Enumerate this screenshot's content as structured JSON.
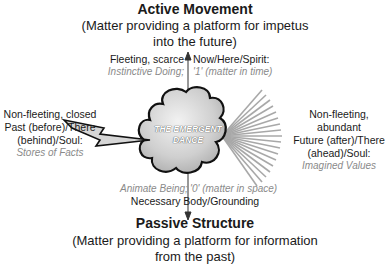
{
  "top": {
    "title": "Active Movement",
    "subtitle_line1": "(Matter providing a platform for impetus",
    "subtitle_line2": "into the future)"
  },
  "upper_left": {
    "label": "Fleeting, scarce",
    "italic": "Instinctive Doing;"
  },
  "upper_right": {
    "label": "Now/Here/Spirit:",
    "italic": "'1' (matter in time)"
  },
  "left": {
    "line1": "Non-fleeting, closed",
    "line2": "Past (before)/There",
    "line3": "(behind)/Soul:",
    "italic": "Stores of Facts"
  },
  "right": {
    "line1": "Non-fleeting, abundant",
    "line2": "Future (after)/There",
    "line3": "(ahead)/Soul:",
    "italic": "Imagined Values"
  },
  "center": {
    "line1": "THE EMERGENT",
    "line2": "DANCE"
  },
  "lower_left": {
    "italic": "Animate Being;"
  },
  "lower_right": {
    "italic": "'0' (matter in space)"
  },
  "lower_center": {
    "label": "Necessary Body/Grounding"
  },
  "bottom": {
    "title": "Passive Structure",
    "subtitle_line1": "(Matter providing a platform for information",
    "subtitle_line2": "from the past)"
  },
  "icons": {
    "center": "cloud-icon",
    "left": "lightning-bolt-icon",
    "right": "radiating-rays-icon",
    "axis": "vertical-double-arrow"
  }
}
